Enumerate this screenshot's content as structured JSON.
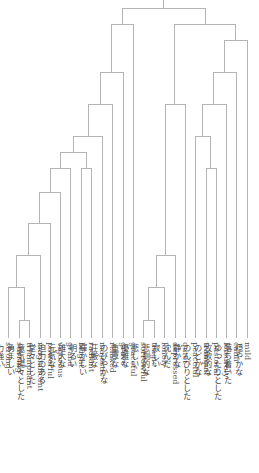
{
  "chart_data": {
    "type": "dendrogram",
    "orientation": "top-down",
    "leaves": [
      {
        "en": "strong",
        "ja": "力強い",
        "x": 8
      },
      {
        "en": "stirring",
        "ja": "勇ましい",
        "x": 19
      },
      {
        "en": "triumphant",
        "ja": "意気揚々とした",
        "x": 29
      },
      {
        "en": "magnificent",
        "ja": "堂々とした",
        "x": 40
      },
      {
        "en": "powerful",
        "ja": "迫力のある",
        "x": 50
      },
      {
        "en": "vigorous",
        "ja": "元気な",
        "x": 60
      },
      {
        "en": "grand",
        "ja": "雄大な",
        "x": 70
      },
      {
        "en": "bright",
        "ja": "明るい",
        "x": 81
      },
      {
        "en": "radiant",
        "ja": "輝かしい",
        "x": 91
      },
      {
        "en": "majestic",
        "ja": "荘厳な",
        "x": 102
      },
      {
        "en": "relaxed",
        "ja": "のびやかな",
        "x": 112
      },
      {
        "en": "grave",
        "ja": "重厚な",
        "x": 123
      },
      {
        "en": "graceful",
        "ja": "優雅な",
        "x": 133
      },
      {
        "en": "sorrowful",
        "ja": "悲しい",
        "x": 143
      },
      {
        "en": "tragic",
        "ja": "悲劇的な",
        "x": 154
      },
      {
        "en": "lonely",
        "ja": "寂しい",
        "x": 164
      },
      {
        "en": "depressed",
        "ja": "沈んだ",
        "x": 175
      },
      {
        "en": "quiet",
        "ja": "静かな",
        "x": 185
      },
      {
        "en": "peaceful",
        "ja": "のんびりとした",
        "x": 195
      },
      {
        "en": "tranquil",
        "ja": "のどかな",
        "x": 206
      },
      {
        "en": "pastoral",
        "ja": "牧歌的な",
        "x": 216
      },
      {
        "en": "leisurely",
        "ja": "ゆったりとした",
        "x": 226
      },
      {
        "en": "calm",
        "ja": "落ち着いた",
        "x": 236
      },
      {
        "en": "mild",
        "ja": "穏やかな",
        "x": 247
      }
    ],
    "leaf_baseline_y": 338,
    "links": [
      {
        "left": 19,
        "right": 29,
        "y": 320,
        "ly": 338,
        "ry": 338,
        "node": 24
      },
      {
        "left": 8,
        "right": 24,
        "y": 287,
        "ly": 338,
        "ry": 320,
        "node": 16
      },
      {
        "left": 16,
        "right": 40,
        "y": 255,
        "ly": 287,
        "ry": 338,
        "node": 28
      },
      {
        "left": 28,
        "right": 50,
        "y": 223,
        "ly": 255,
        "ry": 338,
        "node": 39
      },
      {
        "left": 39,
        "right": 60,
        "y": 192,
        "ly": 223,
        "ry": 338,
        "node": 50
      },
      {
        "left": 50,
        "right": 70,
        "y": 168,
        "ly": 192,
        "ry": 338,
        "node": 60
      },
      {
        "left": 81,
        "right": 91,
        "y": 168,
        "ly": 338,
        "ry": 338,
        "node": 86
      },
      {
        "left": 60,
        "right": 86,
        "y": 152,
        "ly": 168,
        "ry": 168,
        "node": 73
      },
      {
        "left": 73,
        "right": 102,
        "y": 136,
        "ly": 152,
        "ry": 338,
        "node": 88
      },
      {
        "left": 88,
        "right": 112,
        "y": 104,
        "ly": 136,
        "ry": 338,
        "node": 100
      },
      {
        "left": 100,
        "right": 123,
        "y": 72,
        "ly": 104,
        "ry": 338,
        "node": 111
      },
      {
        "left": 111,
        "right": 133,
        "y": 24,
        "ly": 72,
        "ry": 338,
        "node": 122
      },
      {
        "left": 143,
        "right": 154,
        "y": 320,
        "ly": 338,
        "ry": 338,
        "node": 148
      },
      {
        "left": 148,
        "right": 164,
        "y": 287,
        "ly": 320,
        "ry": 338,
        "node": 156
      },
      {
        "left": 156,
        "right": 175,
        "y": 255,
        "ly": 287,
        "ry": 338,
        "node": 165
      },
      {
        "left": 165,
        "right": 185,
        "y": 104,
        "ly": 255,
        "ry": 338,
        "node": 174
      },
      {
        "left": 206,
        "right": 216,
        "y": 168,
        "ly": 338,
        "ry": 338,
        "node": 210
      },
      {
        "left": 195,
        "right": 210,
        "y": 136,
        "ly": 338,
        "ry": 168,
        "node": 202
      },
      {
        "left": 202,
        "right": 226,
        "y": 104,
        "ly": 136,
        "ry": 338,
        "node": 213
      },
      {
        "left": 213,
        "right": 236,
        "y": 72,
        "ly": 104,
        "ry": 338,
        "node": 224
      },
      {
        "left": 224,
        "right": 247,
        "y": 40,
        "ly": 72,
        "ry": 338,
        "node": 235
      },
      {
        "left": 174,
        "right": 235,
        "y": 24,
        "ly": 104,
        "ry": 40,
        "node": 205
      },
      {
        "left": 122,
        "right": 205,
        "y": 8,
        "ly": 24,
        "ry": 24,
        "node": 163
      }
    ],
    "root": {
      "x": 163,
      "y_top": 0,
      "y_bottom": 8
    },
    "line_color": "#b4b4b4"
  }
}
